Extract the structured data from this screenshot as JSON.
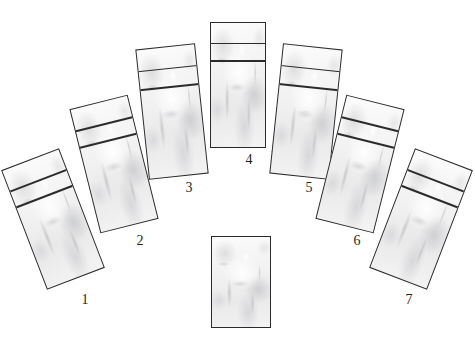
{
  "canvas": {
    "width": 475,
    "height": 350,
    "background_color": "#ffffff",
    "title": "Seven card arc spread with one center card"
  },
  "style": {
    "card_border_color": "#2b2b2b",
    "card_fill_color": "#f2f2f3",
    "label_color": "#1f1f1f",
    "band_rule_color": "#2b2b2b"
  },
  "cards": [
    {
      "id": "card-1",
      "label": "1",
      "x": 22,
      "y": 155,
      "width": 62,
      "height": 128,
      "rotation_deg": -21,
      "has_bands": true,
      "band1_top_pct": 17,
      "band2_top_pct": 30,
      "label_dx": 52,
      "label_dy": 138
    },
    {
      "id": "card-2",
      "label": "2",
      "x": 84,
      "y": 100,
      "width": 60,
      "height": 128,
      "rotation_deg": -14,
      "has_bands": true,
      "band1_top_pct": 17,
      "band2_top_pct": 30,
      "label_dx": 45,
      "label_dy": 134
    },
    {
      "id": "card-3",
      "label": "3",
      "x": 142,
      "y": 46,
      "width": 60,
      "height": 131,
      "rotation_deg": -6,
      "has_bands": true,
      "band1_top_pct": 16,
      "band2_top_pct": 30,
      "label_dx": 36,
      "label_dy": 135
    },
    {
      "id": "card-4",
      "label": "4",
      "x": 210,
      "y": 22,
      "width": 56,
      "height": 126,
      "rotation_deg": 0,
      "has_bands": true,
      "band1_top_pct": 16,
      "band2_top_pct": 30,
      "label_dx": 28,
      "label_dy": 131
    },
    {
      "id": "card-5",
      "label": "5",
      "x": 276,
      "y": 46,
      "width": 60,
      "height": 131,
      "rotation_deg": 6,
      "has_bands": true,
      "band1_top_pct": 16,
      "band2_top_pct": 30,
      "label_dx": 22,
      "label_dy": 135
    },
    {
      "id": "card-6",
      "label": "6",
      "x": 330,
      "y": 100,
      "width": 60,
      "height": 128,
      "rotation_deg": 14,
      "has_bands": true,
      "band1_top_pct": 17,
      "band2_top_pct": 30,
      "label_dx": 16,
      "label_dy": 134
    },
    {
      "id": "card-7",
      "label": "7",
      "x": 390,
      "y": 155,
      "width": 62,
      "height": 128,
      "rotation_deg": 21,
      "has_bands": true,
      "band1_top_pct": 17,
      "band2_top_pct": 30,
      "label_dx": 8,
      "label_dy": 138
    },
    {
      "id": "card-center",
      "label": "",
      "x": 211,
      "y": 236,
      "width": 60,
      "height": 92,
      "rotation_deg": 0,
      "has_bands": false,
      "band1_top_pct": 0,
      "band2_top_pct": 0,
      "label_dx": 0,
      "label_dy": 0
    }
  ]
}
